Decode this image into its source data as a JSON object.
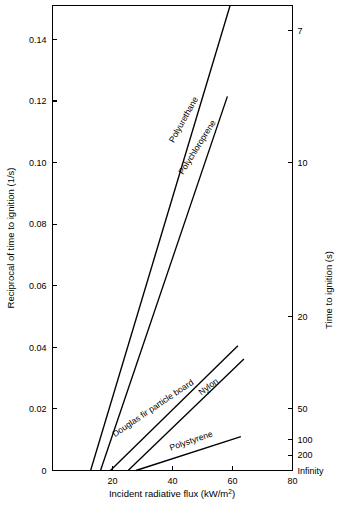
{
  "chart_data": {
    "type": "line",
    "title": "",
    "xlabel": "Incident radiative flux (kW/m2)",
    "xlabel_main": "Incident radiative flux (kW/m",
    "xlabel_sup": "2",
    "xlabel_tail": ")",
    "ylabel": "Reciprocal of time to ignition (1/s)",
    "ylabel_right": "Time to ignition (s)",
    "xlim": [
      0,
      80
    ],
    "ylim": [
      0,
      0.151
    ],
    "grid": false,
    "legend": "inline-series-labels",
    "xticks": [
      0,
      20,
      40,
      60,
      80
    ],
    "xticklabels": [
      "",
      "20",
      "40",
      "60",
      "80"
    ],
    "yticks": [
      0,
      0.02,
      0.04,
      0.06,
      0.08,
      0.1,
      0.12,
      0.14
    ],
    "yticklabels": [
      "0",
      "0.02",
      "0.04",
      "0.06",
      "0.08",
      "0.10",
      "0.12",
      "0.14"
    ],
    "right_axis": {
      "label": "Time to ignition (s)",
      "ticks": [
        {
          "time": "7",
          "recip": 0.1429
        },
        {
          "time": "10",
          "recip": 0.1
        },
        {
          "time": "20",
          "recip": 0.05
        },
        {
          "time": "50",
          "recip": 0.02
        },
        {
          "time": "100",
          "recip": 0.01
        },
        {
          "time": "200",
          "recip": 0.005
        },
        {
          "time": "Infinity",
          "recip": 0.0
        }
      ]
    },
    "series": [
      {
        "name": "Polyurethane",
        "points": [
          [
            12.7,
            0.0
          ],
          [
            59.2,
            0.151
          ]
        ],
        "label_x": 44.5,
        "label_y": 0.1135,
        "label_rotation": -61
      },
      {
        "name": "Polychloroprene",
        "points": [
          [
            16.0,
            0.0
          ],
          [
            58.3,
            0.1215
          ]
        ],
        "label_x": 49.0,
        "label_y": 0.1045,
        "label_rotation": -58
      },
      {
        "name": "Douglas fir particle board",
        "points": [
          [
            19.3,
            0.0
          ],
          [
            61.8,
            0.0405
          ]
        ],
        "label_x": 34.0,
        "label_y": 0.0195,
        "label_rotation": -34
      },
      {
        "name": "Nylon",
        "points": [
          [
            25.2,
            0.0
          ],
          [
            63.8,
            0.0362
          ]
        ],
        "label_x": 52.5,
        "label_y": 0.0265,
        "label_rotation": -37
      },
      {
        "name": "Polystyrene",
        "points": [
          [
            27.8,
            0.0
          ],
          [
            62.8,
            0.011
          ]
        ],
        "label_x": 46.5,
        "label_y": 0.0088,
        "label_rotation": -19
      }
    ]
  }
}
